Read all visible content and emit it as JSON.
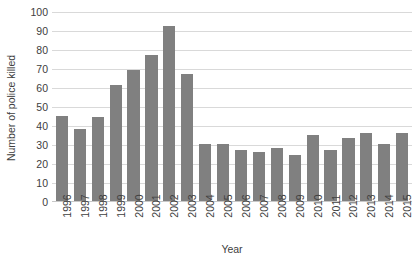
{
  "chart_data": {
    "type": "bar",
    "title": "",
    "xlabel": "Year",
    "ylabel": "Number of police killed",
    "categories": [
      "1996",
      "1997",
      "1998",
      "1999",
      "2000",
      "2001",
      "2002",
      "2003",
      "2004",
      "2005",
      "2006",
      "2007",
      "2008",
      "2009",
      "2010",
      "2011",
      "2012",
      "2013",
      "2014",
      "2015"
    ],
    "values": [
      45,
      38,
      44,
      61,
      69,
      77,
      92,
      67,
      30,
      30,
      27,
      26,
      28,
      24,
      35,
      27,
      33,
      36,
      30,
      36
    ],
    "ylim": [
      0,
      100
    ],
    "yticks": [
      0,
      10,
      20,
      30,
      40,
      50,
      60,
      70,
      80,
      90,
      100
    ],
    "ytick_labels": [
      "0",
      "10",
      "20",
      "30",
      "40",
      "50",
      "60",
      "70",
      "80",
      "90",
      "100"
    ],
    "grid": true,
    "legend": "none",
    "bar_color": "#808080",
    "gridline_color": "#d9d9d9",
    "axis_color": "#c8c8c8",
    "text_color": "#404040"
  }
}
